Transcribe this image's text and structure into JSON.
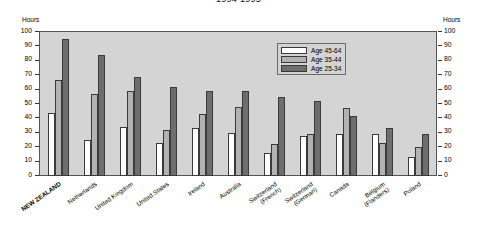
{
  "chart_data": {
    "type": "bar",
    "title": "1994-1995",
    "xlabel": "",
    "ylabel": "Hours",
    "ylabel_right": "Hours",
    "ylim": [
      0,
      100
    ],
    "yticks": [
      100,
      90,
      80,
      70,
      60,
      50,
      40,
      30,
      20,
      10,
      0
    ],
    "grid": false,
    "legend_position": "top-right",
    "highlight_category": "NEW ZEALAND",
    "categories": [
      "NEW ZEALAND",
      "Netherlands",
      "United Kingdom",
      "United States",
      "Ireland",
      "Australia",
      "Switzerland\n(French)",
      "Switzerland\n(German)",
      "Canada",
      "Belgium\n(Flanders)",
      "Poland"
    ],
    "series": [
      {
        "name": "Age 45-64",
        "color": "#ffffff",
        "values": [
          44,
          25,
          34,
          23,
          33,
          30,
          16,
          28,
          29,
          29,
          13
        ]
      },
      {
        "name": "Age 35-44",
        "color": "#b2b2b2",
        "values": [
          67,
          57,
          59,
          32,
          43,
          48,
          22,
          29,
          47,
          23,
          20
        ]
      },
      {
        "name": "Age 25-34",
        "color": "#6e6e6e",
        "values": [
          95,
          84,
          69,
          62,
          59,
          59,
          55,
          52,
          42,
          33,
          29
        ]
      }
    ]
  },
  "colors": {
    "plot_background": "#d4d4d4",
    "page_background": "#ffffff",
    "frame": "#555555",
    "bar_outline": "#3a3a3a"
  }
}
